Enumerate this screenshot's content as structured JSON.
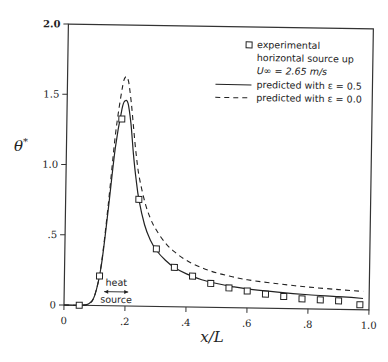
{
  "chart_data": {
    "type": "line",
    "title": "",
    "xlabel": "x/L",
    "ylabel": "θ*",
    "xlim": [
      0,
      1.0
    ],
    "ylim": [
      0,
      2.0
    ],
    "xticks": [
      0,
      0.2,
      0.4,
      0.6,
      0.8,
      1.0
    ],
    "xtick_labels": [
      "0",
      ".2",
      ".4",
      ".6",
      ".8",
      "1.0"
    ],
    "yticks": [
      0,
      0.5,
      1.0,
      1.5,
      2.0
    ],
    "ytick_labels": [
      "0",
      ".5",
      "1.0",
      "1.5",
      "2.0"
    ],
    "grid": false,
    "legend_position": "upper right",
    "legend": [
      {
        "marker": "square",
        "lines": [
          "experimental",
          "horizontal source up",
          "U∞ = 2.65 m/s"
        ]
      },
      {
        "style": "solid",
        "label": "predicted with ε = 0.5"
      },
      {
        "style": "dashed",
        "label": "predicted with ε = 0.0"
      }
    ],
    "series": [
      {
        "name": "experimental horizontal source up U∞ = 2.65 m/s",
        "style": "markers",
        "x": [
          0.05,
          0.115,
          0.18,
          0.24,
          0.3,
          0.36,
          0.42,
          0.48,
          0.54,
          0.6,
          0.66,
          0.72,
          0.78,
          0.84,
          0.9,
          0.97
        ],
        "y": [
          0.0,
          0.21,
          1.33,
          0.76,
          0.41,
          0.28,
          0.22,
          0.17,
          0.14,
          0.12,
          0.1,
          0.085,
          0.07,
          0.065,
          0.06,
          0.035
        ]
      },
      {
        "name": "predicted with ε = 0.5",
        "style": "solid",
        "x": [
          0,
          0.05,
          0.08,
          0.1,
          0.12,
          0.14,
          0.16,
          0.18,
          0.19,
          0.2,
          0.21,
          0.22,
          0.23,
          0.24,
          0.26,
          0.28,
          0.3,
          0.33,
          0.36,
          0.4,
          0.45,
          0.5,
          0.55,
          0.6,
          0.7,
          0.8,
          0.9,
          0.98
        ],
        "y": [
          0,
          0,
          0.01,
          0.07,
          0.28,
          0.68,
          1.12,
          1.4,
          1.46,
          1.44,
          1.3,
          1.08,
          0.9,
          0.76,
          0.58,
          0.47,
          0.4,
          0.33,
          0.28,
          0.235,
          0.195,
          0.17,
          0.15,
          0.135,
          0.115,
          0.1,
          0.09,
          0.08
        ]
      },
      {
        "name": "predicted with ε = 0.0",
        "style": "dashed",
        "x": [
          0,
          0.05,
          0.08,
          0.1,
          0.12,
          0.14,
          0.16,
          0.18,
          0.19,
          0.2,
          0.21,
          0.22,
          0.23,
          0.24,
          0.26,
          0.28,
          0.3,
          0.33,
          0.36,
          0.4,
          0.45,
          0.5,
          0.55,
          0.6,
          0.7,
          0.8,
          0.9,
          0.98
        ],
        "y": [
          0,
          0,
          0.01,
          0.07,
          0.29,
          0.72,
          1.22,
          1.55,
          1.63,
          1.6,
          1.45,
          1.25,
          1.06,
          0.92,
          0.74,
          0.62,
          0.54,
          0.45,
          0.39,
          0.33,
          0.28,
          0.245,
          0.22,
          0.2,
          0.175,
          0.155,
          0.14,
          0.13
        ]
      }
    ],
    "annotations": [
      {
        "text_top": "heat",
        "text_bottom": "source",
        "arrow": "double",
        "x_range": [
          0.135,
          0.215
        ]
      }
    ]
  },
  "labels": {
    "xlabel": "x/L",
    "ylabel_main": "θ",
    "ylabel_sup": "*",
    "legend_exp_1": "experimental",
    "legend_exp_2": "horizontal source up",
    "legend_exp_3": "U∞ = 2.65 m/s",
    "legend_solid": "predicted with ε = 0.5",
    "legend_dashed": "predicted with ε = 0.0",
    "heat": "heat",
    "source": "source"
  }
}
